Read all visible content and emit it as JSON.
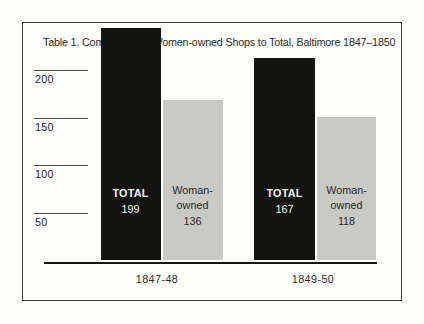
{
  "chart": {
    "title": "Table 1. Comparison of Women-owned Shops to Total, Baltimore 1847–1850",
    "colors": {
      "total_bar": "#131312",
      "woman_owned_bar": "#c9c9c6",
      "frame_border": "#3e3e3c",
      "axis_line": "#161614",
      "tick_line": "#4b4b49",
      "text": "#2d2d2b",
      "bar_text_on_black": "#f4f4f1",
      "bar_text_on_gray": "#292927"
    }
  },
  "yaxis": {
    "t200": "200",
    "t150": "150",
    "t100": "100",
    "t50": "50"
  },
  "xaxis": {
    "g1": "1847-48",
    "g2": "1849-50"
  },
  "bars": {
    "g1_total": {
      "label": "TOTAL",
      "value": "199"
    },
    "g1_woman": {
      "line1": "Woman-",
      "line2": "owned",
      "value": "136"
    },
    "g2_total": {
      "label": "TOTAL",
      "value": "167"
    },
    "g2_woman": {
      "line1": "Woman-",
      "line2": "owned",
      "value": "118"
    }
  },
  "chart_data": {
    "type": "bar",
    "title": "Table 1. Comparison of Women-owned Shops to Total, Baltimore 1847–1850",
    "categories": [
      "1847-48",
      "1849-50"
    ],
    "series": [
      {
        "name": "TOTAL",
        "values": [
          199,
          167
        ],
        "color": "#131312"
      },
      {
        "name": "Woman-owned",
        "values": [
          136,
          118
        ],
        "color": "#c9c9c6"
      }
    ],
    "ylabel": "",
    "xlabel": "",
    "ylim": [
      0,
      210
    ],
    "yticks": [
      50,
      100,
      150,
      200
    ],
    "grid": false,
    "legend_position": "labels-inside-bars"
  }
}
